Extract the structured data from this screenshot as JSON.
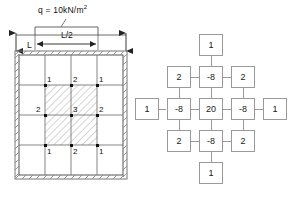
{
  "figure": {
    "colors": {
      "line": "#6f6f6f",
      "heavy_line": "#3a3a3a",
      "node": "#111111",
      "hatch": "#8c8c8c",
      "box_border": "#9a9a9a",
      "background": "#ffffff"
    }
  },
  "left_diagram": {
    "name": "slab-plan-with-fd-grid",
    "load_label": "q = 10kN/m",
    "load_label_exponent": "2",
    "dimensions": [
      {
        "id": "overall-width",
        "label": "L"
      },
      {
        "id": "half-width",
        "label": "L/2"
      }
    ],
    "grid": {
      "divisions_x": 4,
      "divisions_y": 4,
      "hatched_region": {
        "col_start": 1,
        "col_end": 3,
        "row_start": 1,
        "row_end": 3
      },
      "nodes": [
        {
          "row": 0,
          "col": 0,
          "label": "1"
        },
        {
          "row": 0,
          "col": 1,
          "label": "2"
        },
        {
          "row": 0,
          "col": 2,
          "label": "1"
        },
        {
          "row": 1,
          "col": 0,
          "label": "2"
        },
        {
          "row": 1,
          "col": 1,
          "label": "3"
        },
        {
          "row": 1,
          "col": 2,
          "label": "2"
        },
        {
          "row": 2,
          "col": 0,
          "label": "1"
        },
        {
          "row": 2,
          "col": 1,
          "label": "2"
        },
        {
          "row": 2,
          "col": 2,
          "label": "1"
        }
      ]
    },
    "support": "fixed-hatched-boundary"
  },
  "right_diagram": {
    "name": "biharmonic-difference-stencil",
    "cells": [
      {
        "id": "top-far",
        "row": -2,
        "col": 0,
        "value": "1"
      },
      {
        "id": "upper-left",
        "row": -1,
        "col": -1,
        "value": "2"
      },
      {
        "id": "upper-center",
        "row": -1,
        "col": 0,
        "value": "-8"
      },
      {
        "id": "upper-right",
        "row": -1,
        "col": 1,
        "value": "2"
      },
      {
        "id": "left-far",
        "row": 0,
        "col": -2,
        "value": "1"
      },
      {
        "id": "middle-left",
        "row": 0,
        "col": -1,
        "value": "-8"
      },
      {
        "id": "center",
        "row": 0,
        "col": 0,
        "value": "20"
      },
      {
        "id": "middle-right",
        "row": 0,
        "col": 1,
        "value": "-8"
      },
      {
        "id": "right-far",
        "row": 0,
        "col": 2,
        "value": "1"
      },
      {
        "id": "lower-left",
        "row": 1,
        "col": -1,
        "value": "2"
      },
      {
        "id": "lower-center",
        "row": 1,
        "col": 0,
        "value": "-8"
      },
      {
        "id": "lower-right",
        "row": 1,
        "col": 1,
        "value": "2"
      },
      {
        "id": "bottom-far",
        "row": 2,
        "col": 0,
        "value": "1"
      }
    ]
  }
}
